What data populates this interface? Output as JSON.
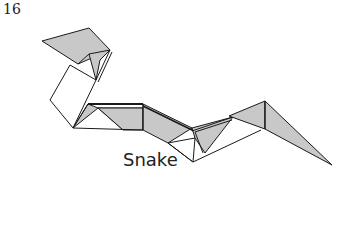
{
  "diagram": {
    "step_number": "16",
    "caption": "Snake",
    "colors": {
      "shaded": "#c8c8c8",
      "line": "#1a1a1a",
      "background": "#ffffff"
    }
  }
}
